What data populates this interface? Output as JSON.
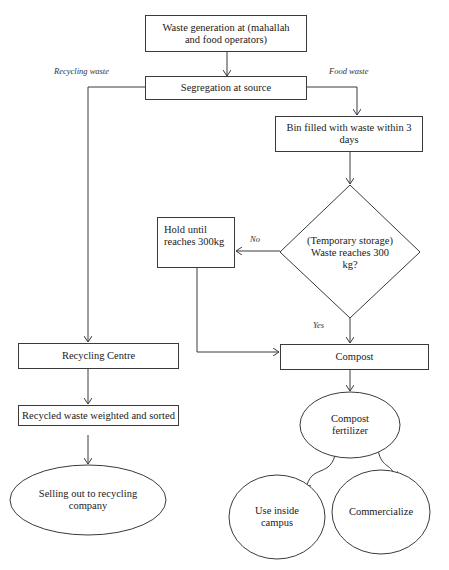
{
  "diagram": {
    "type": "flowchart",
    "nodes": {
      "waste_generation": "Waste generation at (mahallah and food operators)",
      "segregation": "Segregation at source",
      "bin_filled": "Bin filled with waste within 3 days",
      "decision": "(Temporary storage) Waste reaches 300 kg?",
      "hold": "Hold until reaches 300kg",
      "recycling_centre": "Recycling Centre",
      "compost": "Compost",
      "recycled_sorted": "Recycled waste weighted and sorted",
      "selling": "Selling out to recycling company",
      "compost_fertilizer": "Compost fertilizer",
      "use_inside": "Use inside campus",
      "commercialize": "Commercialize"
    },
    "edge_labels": {
      "recycling_waste": "Recycling waste",
      "food_waste": "Food waste",
      "no": "No",
      "yes": "Yes"
    },
    "line_color": "#3a3a3a"
  }
}
